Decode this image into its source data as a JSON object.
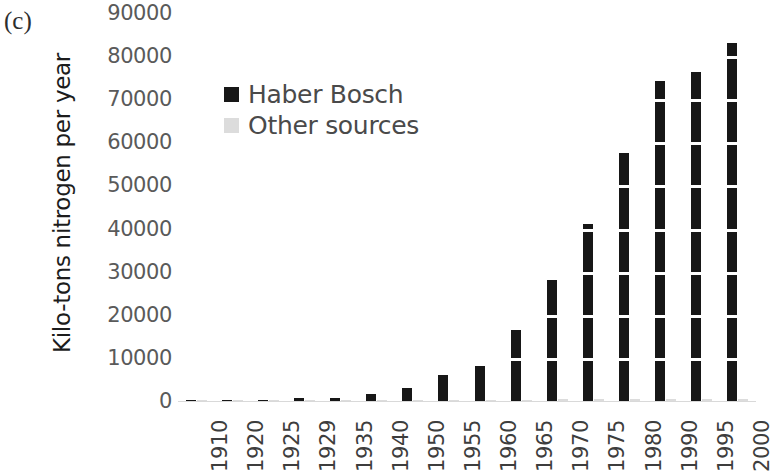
{
  "panel": {
    "label": "(c)"
  },
  "legend": {
    "position": "inside-top-left",
    "items": [
      {
        "label": "Haber Bosch",
        "color": "#171717",
        "swatch": "square-marker-icon"
      },
      {
        "label": "Other sources",
        "color": "#dcdcdc",
        "swatch": "square-marker-icon"
      }
    ]
  },
  "chart_data": {
    "type": "bar",
    "title": "",
    "subtitle": "",
    "xlabel": "",
    "ylabel": "Kilo-tons nitrogen per year",
    "ylim": [
      0,
      90000
    ],
    "ytick_step": 10000,
    "yticks": [
      "90000",
      "80000",
      "70000",
      "60000",
      "50000",
      "40000",
      "30000",
      "20000",
      "10000",
      "0"
    ],
    "ytick_values": [
      90000,
      80000,
      70000,
      60000,
      50000,
      40000,
      30000,
      20000,
      10000,
      0
    ],
    "grid": "horizontal-white-gridlines",
    "legend_position": "inside-top-left",
    "categories": [
      "1910",
      "1920",
      "1925",
      "1929",
      "1935",
      "1940",
      "1950",
      "1955",
      "1960",
      "1965",
      "1970",
      "1975",
      "1980",
      "1990",
      "1995",
      "2000"
    ],
    "series": [
      {
        "name": "Haber Bosch",
        "color": "#171717",
        "values": [
          20,
          120,
          300,
          600,
          700,
          1700,
          3000,
          6000,
          8200,
          16500,
          28000,
          41000,
          57500,
          74300,
          76300,
          83000
        ]
      },
      {
        "name": "Other sources",
        "color": "#dcdcdc",
        "values": [
          150,
          180,
          200,
          220,
          240,
          260,
          280,
          300,
          320,
          340,
          360,
          380,
          400,
          420,
          440,
          460
        ]
      }
    ]
  }
}
